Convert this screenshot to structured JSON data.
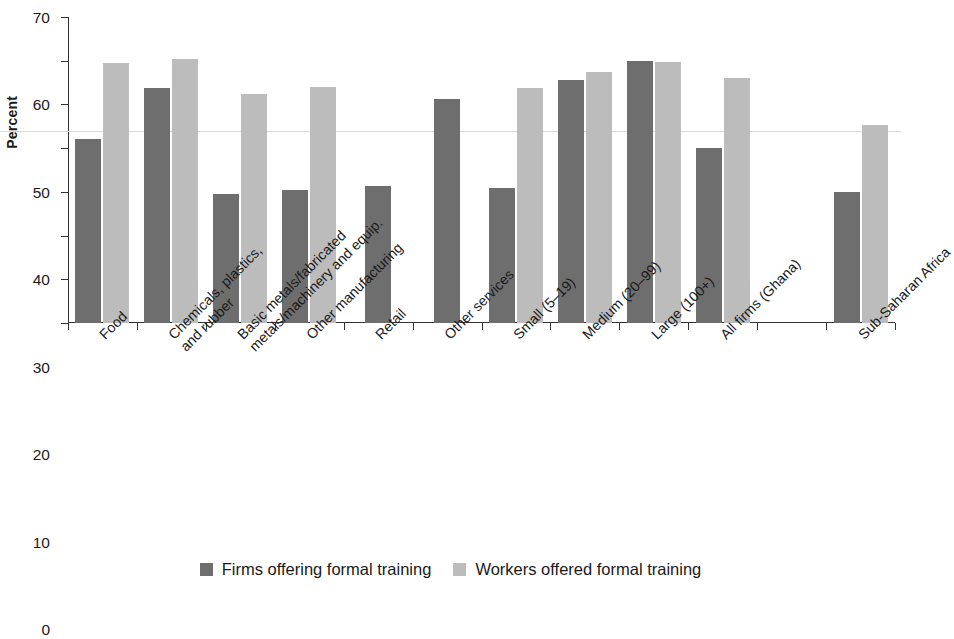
{
  "chart_data": {
    "type": "bar",
    "title": "",
    "xlabel": "",
    "ylabel": "Percent",
    "ylim": [
      0,
      70
    ],
    "yticks": [
      0,
      10,
      20,
      30,
      40,
      50,
      60,
      70
    ],
    "grid": false,
    "legend_position": "bottom",
    "categories": [
      "Food",
      "Chemicals, plastics, and rubber",
      "Basic metals/fabricated metals/machinery and equip.",
      "Other manufacturing",
      "Retail",
      "Other services",
      "Small (5–19)",
      "Medium (20–99)",
      "Large (100+)",
      "All firms (Ghana)",
      "Sub-Saharan Africa"
    ],
    "category_lines": [
      [
        "Food"
      ],
      [
        "Chemicals, plastics,",
        "and rubber"
      ],
      [
        "Basic metals/fabricated",
        "metals/machinery and equip."
      ],
      [
        "Other manufacturing"
      ],
      [
        "Retail"
      ],
      [
        "Other services"
      ],
      [
        "Small (5–19)"
      ],
      [
        "Medium (20–99)"
      ],
      [
        "Large (100+)"
      ],
      [
        "All firms (Ghana)"
      ],
      [
        "Sub-Saharan Africa"
      ]
    ],
    "series": [
      {
        "name": "Firms offering formal training",
        "color": "#6e6e6e",
        "values": [
          42.0,
          53.8,
          29.6,
          30.5,
          31.3,
          51.3,
          31.0,
          55.5,
          60.0,
          40.0,
          30.0
        ]
      },
      {
        "name": "Workers offered formal training",
        "color": "#bcbcbc",
        "values": [
          59.5,
          60.3,
          52.3,
          54.1,
          null,
          null,
          53.8,
          57.5,
          59.8,
          56.0,
          45.3
        ]
      }
    ]
  },
  "legend": {
    "items": [
      {
        "label": "Firms offering formal training",
        "swatch": "dark"
      },
      {
        "label": "Workers offered formal training",
        "swatch": "light"
      }
    ]
  },
  "axis": {
    "y_label": "Percent",
    "y_ticks": [
      "0",
      "10",
      "20",
      "30",
      "40",
      "50",
      "60",
      "70"
    ]
  }
}
